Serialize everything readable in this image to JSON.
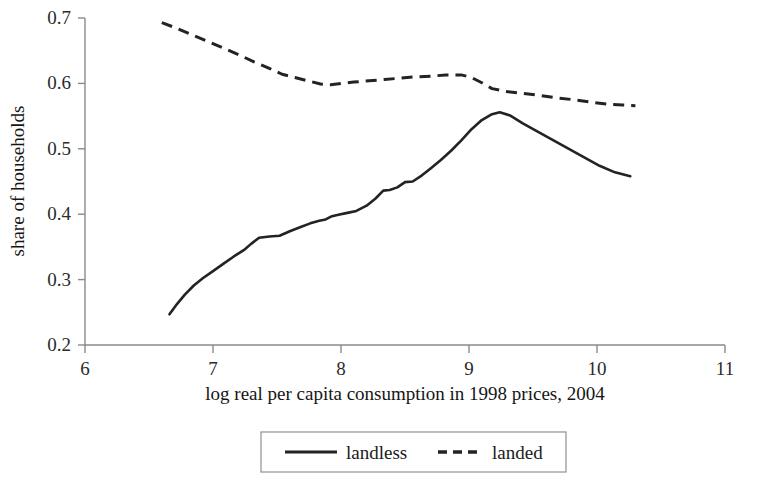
{
  "chart_data": {
    "type": "line",
    "title": "",
    "xlabel": "log real per capita consumption in 1998 prices, 2004",
    "ylabel": "share of households",
    "xlim": [
      6,
      11
    ],
    "ylim": [
      0.2,
      0.7
    ],
    "xticks": [
      "6",
      "7",
      "8",
      "9",
      "10",
      "11"
    ],
    "yticks": [
      "0.2",
      "0.3",
      "0.4",
      "0.5",
      "0.6",
      "0.7"
    ],
    "grid": false,
    "legend_position": "bottom-center",
    "series": [
      {
        "name": "landless",
        "style": "solid",
        "color": "#232323",
        "points": [
          [
            6.66,
            0.247
          ],
          [
            6.72,
            0.263
          ],
          [
            6.78,
            0.277
          ],
          [
            6.85,
            0.291
          ],
          [
            6.92,
            0.302
          ],
          [
            7.0,
            0.313
          ],
          [
            7.08,
            0.324
          ],
          [
            7.16,
            0.335
          ],
          [
            7.24,
            0.345
          ],
          [
            7.3,
            0.355
          ],
          [
            7.36,
            0.364
          ],
          [
            7.44,
            0.366
          ],
          [
            7.52,
            0.367
          ],
          [
            7.6,
            0.374
          ],
          [
            7.68,
            0.38
          ],
          [
            7.76,
            0.386
          ],
          [
            7.83,
            0.39
          ],
          [
            7.88,
            0.392
          ],
          [
            7.93,
            0.397
          ],
          [
            7.98,
            0.399
          ],
          [
            8.05,
            0.402
          ],
          [
            8.12,
            0.405
          ],
          [
            8.2,
            0.413
          ],
          [
            8.27,
            0.424
          ],
          [
            8.33,
            0.436
          ],
          [
            8.38,
            0.437
          ],
          [
            8.44,
            0.441
          ],
          [
            8.5,
            0.449
          ],
          [
            8.56,
            0.45
          ],
          [
            8.63,
            0.459
          ],
          [
            8.7,
            0.47
          ],
          [
            8.78,
            0.483
          ],
          [
            8.86,
            0.497
          ],
          [
            8.94,
            0.513
          ],
          [
            9.02,
            0.53
          ],
          [
            9.1,
            0.544
          ],
          [
            9.18,
            0.553
          ],
          [
            9.24,
            0.556
          ],
          [
            9.32,
            0.551
          ],
          [
            9.42,
            0.539
          ],
          [
            9.54,
            0.526
          ],
          [
            9.66,
            0.513
          ],
          [
            9.78,
            0.5
          ],
          [
            9.9,
            0.487
          ],
          [
            10.02,
            0.474
          ],
          [
            10.14,
            0.464
          ],
          [
            10.26,
            0.458
          ]
        ]
      },
      {
        "name": "landed",
        "style": "dashed",
        "color": "#232323",
        "points": [
          [
            6.6,
            0.693
          ],
          [
            6.72,
            0.684
          ],
          [
            6.84,
            0.674
          ],
          [
            6.96,
            0.664
          ],
          [
            7.08,
            0.654
          ],
          [
            7.2,
            0.644
          ],
          [
            7.32,
            0.633
          ],
          [
            7.44,
            0.623
          ],
          [
            7.54,
            0.614
          ],
          [
            7.64,
            0.609
          ],
          [
            7.74,
            0.604
          ],
          [
            7.84,
            0.599
          ],
          [
            7.92,
            0.598
          ],
          [
            8.0,
            0.6
          ],
          [
            8.1,
            0.602
          ],
          [
            8.22,
            0.604
          ],
          [
            8.34,
            0.606
          ],
          [
            8.46,
            0.608
          ],
          [
            8.58,
            0.61
          ],
          [
            8.7,
            0.611
          ],
          [
            8.82,
            0.613
          ],
          [
            8.94,
            0.613
          ],
          [
            9.02,
            0.609
          ],
          [
            9.1,
            0.601
          ],
          [
            9.18,
            0.592
          ],
          [
            9.28,
            0.588
          ],
          [
            9.4,
            0.585
          ],
          [
            9.54,
            0.582
          ],
          [
            9.68,
            0.578
          ],
          [
            9.82,
            0.575
          ],
          [
            9.96,
            0.571
          ],
          [
            10.1,
            0.568
          ],
          [
            10.2,
            0.567
          ],
          [
            10.3,
            0.566
          ]
        ]
      }
    ],
    "legend": [
      {
        "label": "landless",
        "style": "solid"
      },
      {
        "label": "landed",
        "style": "dashed"
      }
    ]
  }
}
